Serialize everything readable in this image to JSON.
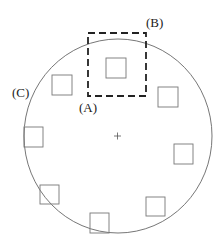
{
  "diagram": {
    "labels": {
      "A": "(A)",
      "B": "(B)",
      "C": "(C)"
    },
    "circle": {
      "cx": 118,
      "cy": 136,
      "rx": 94,
      "ry": 97,
      "stroke": "#555555"
    },
    "center_mark": {
      "x": 117,
      "y": 136
    },
    "dashed_box": {
      "x": 88,
      "y": 33,
      "w": 58,
      "h": 63,
      "stroke": "#222222"
    },
    "squares": [
      {
        "x": 106,
        "y": 58,
        "w": 20,
        "h": 20
      },
      {
        "x": 52,
        "y": 75,
        "w": 20,
        "h": 20
      },
      {
        "x": 158,
        "y": 87,
        "w": 20,
        "h": 20
      },
      {
        "x": 24,
        "y": 127,
        "w": 19,
        "h": 20
      },
      {
        "x": 174,
        "y": 144,
        "w": 19,
        "h": 20
      },
      {
        "x": 40,
        "y": 185,
        "w": 19,
        "h": 19
      },
      {
        "x": 146,
        "y": 197,
        "w": 19,
        "h": 19
      },
      {
        "x": 90,
        "y": 213,
        "w": 19,
        "h": 20
      }
    ]
  }
}
